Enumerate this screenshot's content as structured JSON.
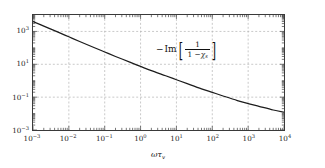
{
  "figure": {
    "background_color": "#ffffff",
    "frame_color": "#3a3a3a",
    "grid_color": "#b0b0b0",
    "curve_color": "#1c1c1c"
  },
  "axes": {
    "x": {
      "label_omega": "ω",
      "label_tau": "τ",
      "label_tau_sub": "v",
      "scale": "log",
      "range": [
        0.001,
        10000
      ],
      "tick_labels": [
        "10⁻³",
        "10⁻²",
        "10⁻¹",
        "10⁰",
        "10¹",
        "10²",
        "10³",
        "10⁴"
      ],
      "tick_bases": [
        "10",
        "10",
        "10",
        "10",
        "10",
        "10",
        "10",
        "10"
      ],
      "tick_exponents": [
        "-3",
        "-2",
        "-1",
        "0",
        "1",
        "2",
        "3",
        "4"
      ],
      "tick_values": [
        0.001,
        0.01,
        0.1,
        1,
        10,
        100,
        1000,
        10000
      ]
    },
    "y": {
      "scale": "log",
      "range": [
        0.001,
        10000
      ],
      "tick_labels": [
        "10³",
        "10¹",
        "10⁻¹",
        "10⁻³"
      ],
      "tick_bases": [
        "10",
        "10",
        "10",
        "10"
      ],
      "tick_exponents": [
        "3",
        "1",
        "-1",
        "-3"
      ],
      "tick_values": [
        1000,
        10,
        0.1,
        0.001
      ]
    }
  },
  "annotation": {
    "minus": "−",
    "operator": "Im",
    "bracket_open": "[",
    "bracket_close": "]",
    "numerator": "1",
    "denominator_lead": "1 −",
    "denominator_symbol": "χ",
    "denominator_subscript": "s",
    "full_text": "−Im[1/(1−χs)]"
  },
  "chart_data": {
    "type": "line",
    "title": "",
    "xlabel": "ωτ_v",
    "ylabel": "",
    "xscale": "log",
    "yscale": "log",
    "xlim": [
      0.001,
      10000
    ],
    "ylim": [
      0.001,
      10000
    ],
    "grid": true,
    "legend": null,
    "series": [
      {
        "name": "-Im[1/(1-chi_s)]",
        "color": "#1c1c1c",
        "x": [
          0.001,
          0.002,
          0.005,
          0.01,
          0.02,
          0.05,
          0.1,
          0.2,
          0.5,
          1,
          2,
          5,
          10,
          20,
          50,
          100,
          200,
          500,
          1000,
          2000,
          5000,
          10000
        ],
        "y": [
          4000,
          2100,
          900,
          470,
          245,
          105,
          56,
          30,
          13.5,
          7.4,
          4.1,
          2.0,
          1.15,
          0.66,
          0.32,
          0.195,
          0.118,
          0.062,
          0.0405,
          0.0275,
          0.0165,
          0.0122
        ]
      }
    ]
  }
}
